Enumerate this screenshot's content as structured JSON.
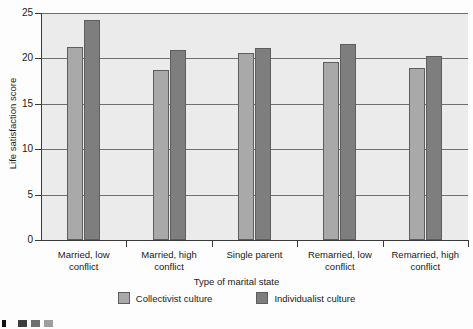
{
  "chart_data": {
    "type": "bar",
    "title": "",
    "xlabel": "Type of marital state",
    "ylabel": "Life satisfaction score",
    "ylim": [
      0,
      25
    ],
    "yticks": [
      0,
      5,
      10,
      15,
      20,
      25
    ],
    "ytick_labels": [
      "0",
      "5",
      "10",
      "15",
      "20",
      "25"
    ],
    "grid": true,
    "legend_position": "bottom",
    "categories": [
      "Married, low conflict",
      "Married, high conflict",
      "Single parent",
      "Remarried, low conflict",
      "Remarried, high conflict"
    ],
    "category_lines": [
      [
        "Married, low",
        "conflict"
      ],
      [
        "Married, high",
        "conflict"
      ],
      [
        "Single parent",
        ""
      ],
      [
        "Remarried, low",
        "conflict"
      ],
      [
        "Remarried, high",
        "conflict"
      ]
    ],
    "series": [
      {
        "name": "Collectivist culture",
        "color": "#a9a9a9",
        "values": [
          21.3,
          18.7,
          20.6,
          19.6,
          18.9
        ]
      },
      {
        "name": "Individualist culture",
        "color": "#7e7e7e",
        "values": [
          24.2,
          20.9,
          21.2,
          21.6,
          20.3
        ]
      }
    ]
  },
  "legend": {
    "items": [
      {
        "label": "Collectivist culture",
        "swatch": "collectivist"
      },
      {
        "label": "Individualist culture",
        "swatch": "individualist"
      }
    ]
  },
  "colors": {
    "plot_background": "#ebebeb",
    "page_background": "#fdfdfd",
    "axis": "#3a3a3a",
    "gridline": "#6f6f6f",
    "collectivist": "#a9a9a9",
    "individualist": "#7e7e7e",
    "bar_border": "#5e5e5e"
  },
  "bottom_strip": {
    "chips": [
      {
        "color": "#111111",
        "left": 2,
        "width": 4
      },
      {
        "color": "#3c3c3c",
        "left": 18,
        "width": 9
      },
      {
        "color": "#6e6e6e",
        "left": 31,
        "width": 9
      },
      {
        "color": "#9e9e9e",
        "left": 44,
        "width": 9
      }
    ]
  }
}
